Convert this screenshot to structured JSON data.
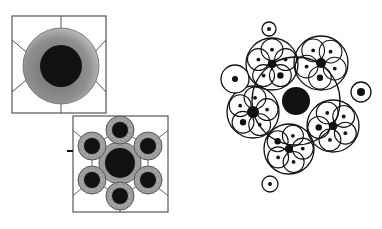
{
  "figure": {
    "colors": {
      "ink": "#111111",
      "ring_shade": "#8a8a8a",
      "ring_shade_light": "#b8b8b8",
      "paper": "#ffffff",
      "frame": "#555555"
    }
  },
  "panels": {
    "top_square": {
      "x": 12,
      "y": 16,
      "w": 94,
      "h": 97,
      "center": [
        61,
        66
      ],
      "core_r": 21,
      "ring_r": 38
    },
    "bottom_square": {
      "x": 73,
      "y": 116,
      "w": 95,
      "h": 96,
      "center": [
        120,
        163
      ],
      "center_core_r": 15,
      "center_ring_r": 21,
      "satellites": [
        {
          "cx": 120,
          "cy": 130
        },
        {
          "cx": 148,
          "cy": 146
        },
        {
          "cx": 148,
          "cy": 180
        },
        {
          "cx": 120,
          "cy": 196
        },
        {
          "cx": 92,
          "cy": 180
        },
        {
          "cx": 92,
          "cy": 146
        }
      ],
      "satellite_core_r": 8,
      "satellite_ring_r": 14
    }
  },
  "cluster": {
    "center": {
      "cx": 296,
      "cy": 101,
      "r": 14
    },
    "outer_ring_r": 44,
    "groups": [
      {
        "cx": 272,
        "cy": 64,
        "r": 26,
        "hub_r": 4
      },
      {
        "cx": 321,
        "cy": 63,
        "r": 27,
        "hub_r": 5
      },
      {
        "cx": 253,
        "cy": 112,
        "r": 26,
        "hub_r": 6
      },
      {
        "cx": 333,
        "cy": 126,
        "r": 26,
        "hub_r": 4
      },
      {
        "cx": 289,
        "cy": 149,
        "r": 25,
        "hub_r": 4
      }
    ],
    "isolated": [
      {
        "cx": 269,
        "cy": 29,
        "r": 7,
        "dot_r": 2
      },
      {
        "cx": 235,
        "cy": 79,
        "r": 14,
        "dot_r": 3
      },
      {
        "cx": 361,
        "cy": 92,
        "r": 10,
        "dot_r": 4
      },
      {
        "cx": 270,
        "cy": 184,
        "r": 8,
        "dot_r": 2
      }
    ]
  }
}
